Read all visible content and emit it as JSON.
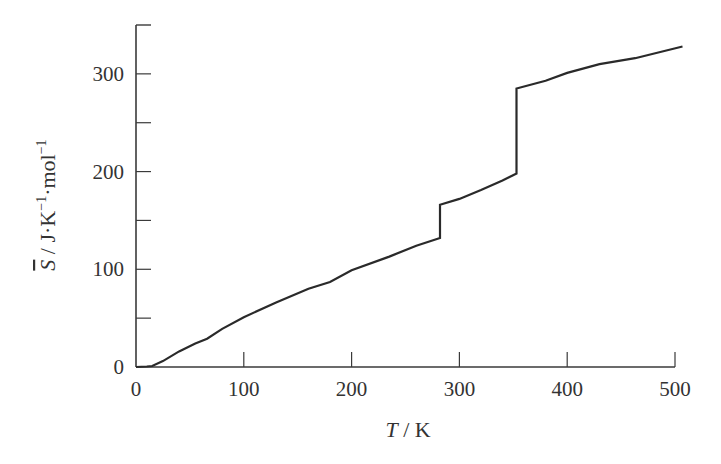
{
  "chart_data": {
    "type": "line",
    "title": "",
    "xlabel": "T / K",
    "xlabel_parts": {
      "var": "T",
      "unit": " / K"
    },
    "ylabel": "S̄ / J·K⁻¹·mol⁻¹",
    "ylabel_parts": {
      "var": "S",
      "rest": " / J·K",
      "sup1": "−1",
      "mid": "·mol",
      "sup2": "−1"
    },
    "xlim": [
      0,
      500
    ],
    "ylim": [
      0,
      350
    ],
    "xticks": [
      0,
      100,
      200,
      300,
      400,
      500
    ],
    "xtick_labels": [
      "0",
      "100",
      "200",
      "300",
      "400",
      "500"
    ],
    "yticks_major": [
      0,
      100,
      200,
      300
    ],
    "ytick_labels": [
      "0",
      "100",
      "200",
      "300"
    ],
    "yticks_minor": [
      50,
      150,
      250
    ],
    "grid": false,
    "legend": null,
    "series": [
      {
        "name": "Molar entropy",
        "color": "#2a2a2a",
        "points": [
          [
            0,
            0
          ],
          [
            10,
            0.5
          ],
          [
            15,
            1
          ],
          [
            25,
            6
          ],
          [
            40,
            16
          ],
          [
            55,
            24
          ],
          [
            66,
            29
          ],
          [
            80,
            39
          ],
          [
            100,
            51
          ],
          [
            130,
            66
          ],
          [
            160,
            80
          ],
          [
            180,
            87
          ],
          [
            200,
            99
          ],
          [
            235,
            113
          ],
          [
            260,
            124
          ],
          [
            282,
            132
          ],
          [
            282,
            166
          ],
          [
            300,
            172
          ],
          [
            320,
            181
          ],
          [
            340,
            191
          ],
          [
            353,
            198
          ],
          [
            353,
            285
          ],
          [
            380,
            293
          ],
          [
            400,
            301
          ],
          [
            430,
            310
          ],
          [
            463,
            316
          ],
          [
            507,
            328
          ]
        ]
      }
    ],
    "annotations": [
      {
        "text": "phase transition (solid-solid / melting) jump",
        "x": 282,
        "from": 132,
        "to": 166
      },
      {
        "text": "vaporization jump",
        "x": 353,
        "from": 198,
        "to": 285
      }
    ]
  }
}
